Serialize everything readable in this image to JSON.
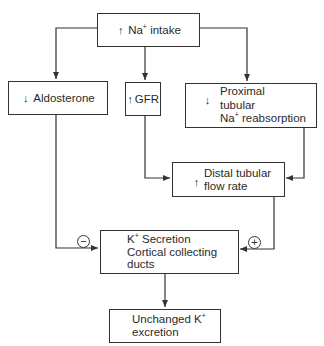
{
  "nodes": {
    "na_intake": {
      "direction": "up",
      "label": "Na",
      "sup": "+",
      "label_rest": " intake"
    },
    "aldosterone": {
      "direction": "down",
      "label": "Aldosterone"
    },
    "gfr": {
      "direction": "up",
      "label": "GFR"
    },
    "proximal": {
      "direction": "down",
      "lines": [
        "Proximal",
        "tubular",
        "Na+ reabsorption"
      ],
      "line3_main": "Na",
      "line3_sup": "+",
      "line3_rest": " reabsorption"
    },
    "distal": {
      "direction": "up",
      "lines": [
        "Distal tubular",
        "flow rate"
      ]
    },
    "k_secretion": {
      "line1_main": "K",
      "line1_sup": "+",
      "line1_rest": " Secretion",
      "line2": "Cortical collecting",
      "line3": "ducts"
    },
    "unchanged": {
      "line1_main": "Unchanged K",
      "line1_sup": "+",
      "line2": "excretion"
    }
  },
  "symbols": {
    "up_arrow": "↑",
    "down_arrow": "↓",
    "minus": "−",
    "plus": "+"
  },
  "edges": [
    {
      "from": "na_intake",
      "to": "aldosterone"
    },
    {
      "from": "na_intake",
      "to": "gfr"
    },
    {
      "from": "na_intake",
      "to": "proximal"
    },
    {
      "from": "gfr",
      "to": "distal"
    },
    {
      "from": "proximal",
      "to": "distal"
    },
    {
      "from": "aldosterone",
      "to": "k_secretion",
      "sign": "-"
    },
    {
      "from": "distal",
      "to": "k_secretion",
      "sign": "+"
    },
    {
      "from": "k_secretion",
      "to": "unchanged"
    }
  ]
}
